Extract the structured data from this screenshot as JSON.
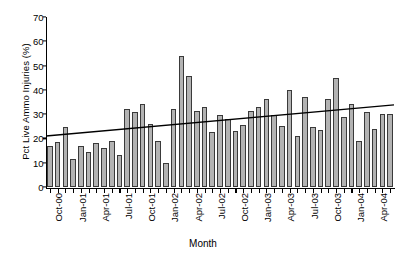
{
  "chart_data": {
    "type": "bar",
    "title": "",
    "xlabel": "Month",
    "ylabel": "Pct Live Ammo Injuries (%)",
    "ylim": [
      0,
      70
    ],
    "yticks": [
      0,
      10,
      20,
      30,
      40,
      50,
      60,
      70
    ],
    "grid": false,
    "legend": "none",
    "bar_color": "#b3b3b3",
    "bar_edge_color": "#3a3a3a",
    "trendline_color": "#000000",
    "categories": [
      "Oct-00",
      "Nov-00",
      "Dec-00",
      "Jan-01",
      "Feb-01",
      "Mar-01",
      "Apr-01",
      "May-01",
      "Jun-01",
      "Jul-01",
      "Aug-01",
      "Sep-01",
      "Oct-01",
      "Nov-01",
      "Dec-01",
      "Jan-02",
      "Feb-02",
      "Mar-02",
      "Apr-02",
      "May-02",
      "Jun-02",
      "Jul-02",
      "Aug-02",
      "Sep-02",
      "Oct-02",
      "Nov-02",
      "Dec-02",
      "Jan-03",
      "Feb-03",
      "Mar-03",
      "Apr-03",
      "May-03",
      "Jun-03",
      "Jul-03",
      "Aug-03",
      "Sep-03",
      "Oct-03",
      "Nov-03",
      "Dec-03",
      "Jan-04",
      "Feb-04",
      "Mar-04",
      "Apr-04",
      "May-04",
      "Jun-04"
    ],
    "values": [
      17.0,
      18.7,
      24.6,
      11.5,
      17.0,
      14.3,
      18.3,
      16.1,
      19.0,
      13.2,
      32.0,
      30.7,
      34.3,
      26.0,
      19.0,
      10.0,
      32.3,
      53.8,
      45.8,
      31.4,
      33.0,
      22.5,
      29.7,
      28.2,
      23.0,
      25.6,
      31.4,
      33.0,
      36.2,
      29.8,
      25.3,
      40.0,
      21.0,
      37.0,
      24.9,
      23.4,
      36.3,
      45.0,
      28.9,
      34.2,
      19.1,
      30.8,
      23.9,
      30.2,
      30.2
    ],
    "tick_labels": [
      "Oct-00",
      "Jan-01",
      "Apr-01",
      "Jul-01",
      "Oct-01",
      "Jan-02",
      "Apr-02",
      "Jul-02",
      "Oct-02",
      "Jan-03",
      "Apr-03",
      "Jul-03",
      "Oct-03",
      "Jan-04",
      "Apr-04"
    ],
    "tick_label_indices": [
      0,
      3,
      6,
      9,
      12,
      15,
      18,
      21,
      24,
      27,
      30,
      33,
      36,
      39,
      42
    ],
    "trendline": {
      "start_value": 21.0,
      "end_value": 33.8
    }
  }
}
